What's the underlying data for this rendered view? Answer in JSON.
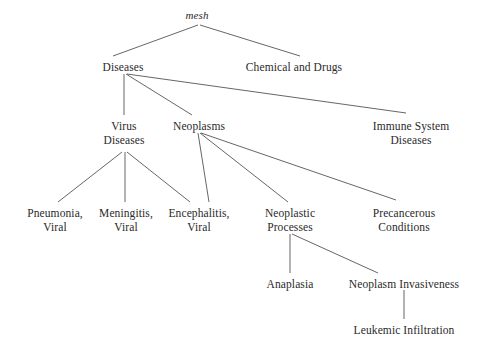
{
  "diagram": {
    "title": "mesh",
    "type": "tree-hierarchy",
    "line_color": "#555555",
    "text_color": "#2a2a2a",
    "background_color": "#ffffff",
    "nodes": [
      {
        "id": "mesh",
        "lines": [
          "mesh"
        ],
        "x": 197,
        "y": 9,
        "italic": true
      },
      {
        "id": "diseases",
        "lines": [
          "Diseases"
        ],
        "x": 123,
        "y": 61,
        "italic": false
      },
      {
        "id": "chemical-and-drugs",
        "lines": [
          "Chemical and Drugs"
        ],
        "x": 294,
        "y": 61,
        "italic": false
      },
      {
        "id": "virus-diseases",
        "lines": [
          "Virus",
          "Diseases"
        ],
        "x": 124,
        "y": 120,
        "italic": false
      },
      {
        "id": "neoplasms",
        "lines": [
          "Neoplasms"
        ],
        "x": 199,
        "y": 120,
        "italic": false
      },
      {
        "id": "immune-system-diseases",
        "lines": [
          "Immune System",
          "Diseases"
        ],
        "x": 411,
        "y": 120,
        "italic": false
      },
      {
        "id": "pneumonia-viral",
        "lines": [
          "Pneumonia,",
          "Viral"
        ],
        "x": 55,
        "y": 207,
        "italic": false
      },
      {
        "id": "meningitis-viral",
        "lines": [
          "Meningitis,",
          "Viral"
        ],
        "x": 126,
        "y": 207,
        "italic": false
      },
      {
        "id": "encephalitis-viral",
        "lines": [
          "Encephalitis,",
          "Viral"
        ],
        "x": 199,
        "y": 207,
        "italic": false
      },
      {
        "id": "neoplastic-processes",
        "lines": [
          "Neoplastic",
          "Processes"
        ],
        "x": 290,
        "y": 207,
        "italic": false
      },
      {
        "id": "precancerous-conditions",
        "lines": [
          "Precancerous",
          "Conditions"
        ],
        "x": 404,
        "y": 207,
        "italic": false
      },
      {
        "id": "anaplasia",
        "lines": [
          "Anaplasia"
        ],
        "x": 290,
        "y": 278,
        "italic": false
      },
      {
        "id": "neoplasm-invasiveness",
        "lines": [
          "Neoplasm Invasiveness"
        ],
        "x": 404,
        "y": 278,
        "italic": false
      },
      {
        "id": "leukemic-infiltration",
        "lines": [
          "Leukemic Infiltration"
        ],
        "x": 404,
        "y": 324,
        "italic": false
      }
    ],
    "edges": [
      {
        "from": "mesh",
        "to": "diseases",
        "x1": 198,
        "y1": 25,
        "x2": 113,
        "y2": 56
      },
      {
        "from": "mesh",
        "to": "chemical-and-drugs",
        "x1": 200,
        "y1": 25,
        "x2": 300,
        "y2": 56
      },
      {
        "from": "diseases",
        "to": "virus-diseases",
        "x1": 124,
        "y1": 74,
        "x2": 124,
        "y2": 115
      },
      {
        "from": "diseases",
        "to": "neoplasms",
        "x1": 126,
        "y1": 74,
        "x2": 192,
        "y2": 115
      },
      {
        "from": "diseases",
        "to": "immune-system-diseases",
        "x1": 127,
        "y1": 74,
        "x2": 406,
        "y2": 113
      },
      {
        "from": "virus-diseases",
        "to": "pneumonia-viral",
        "x1": 122,
        "y1": 152,
        "x2": 58,
        "y2": 202
      },
      {
        "from": "virus-diseases",
        "to": "meningitis-viral",
        "x1": 125,
        "y1": 152,
        "x2": 125,
        "y2": 202
      },
      {
        "from": "virus-diseases",
        "to": "encephalitis-viral",
        "x1": 127,
        "y1": 152,
        "x2": 190,
        "y2": 202
      },
      {
        "from": "neoplasms",
        "to": "encephalitis-viral",
        "x1": 198,
        "y1": 133,
        "x2": 209,
        "y2": 202
      },
      {
        "from": "neoplasms",
        "to": "neoplastic-processes",
        "x1": 200,
        "y1": 133,
        "x2": 288,
        "y2": 202
      },
      {
        "from": "neoplasms",
        "to": "precancerous-conditions",
        "x1": 201,
        "y1": 133,
        "x2": 396,
        "y2": 200
      },
      {
        "from": "neoplastic-processes",
        "to": "anaplasia",
        "x1": 290,
        "y1": 234,
        "x2": 290,
        "y2": 273
      },
      {
        "from": "neoplastic-processes",
        "to": "neoplasm-invasiveness",
        "x1": 292,
        "y1": 234,
        "x2": 378,
        "y2": 273
      },
      {
        "from": "neoplasm-invasiveness",
        "to": "leukemic-infiltration",
        "x1": 404,
        "y1": 290,
        "x2": 404,
        "y2": 319
      }
    ]
  }
}
